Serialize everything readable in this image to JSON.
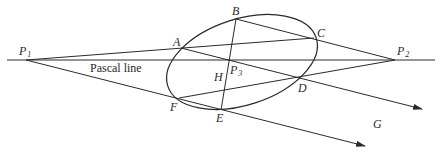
{
  "diagram": {
    "title": "Pascal line",
    "points": {
      "P1": {
        "label": "P",
        "sub": "1"
      },
      "P2": {
        "label": "P",
        "sub": "2"
      },
      "P3": {
        "label": "P",
        "sub": "3"
      },
      "A": {
        "label": "A"
      },
      "B": {
        "label": "B"
      },
      "C": {
        "label": "C"
      },
      "D": {
        "label": "D"
      },
      "E": {
        "label": "E"
      },
      "F": {
        "label": "F"
      },
      "G": {
        "label": "G"
      },
      "H": {
        "label": "H"
      }
    },
    "line_label": "Pascal line",
    "colors": {
      "stroke": "#2a2a2a",
      "background": "#ffffff"
    }
  }
}
